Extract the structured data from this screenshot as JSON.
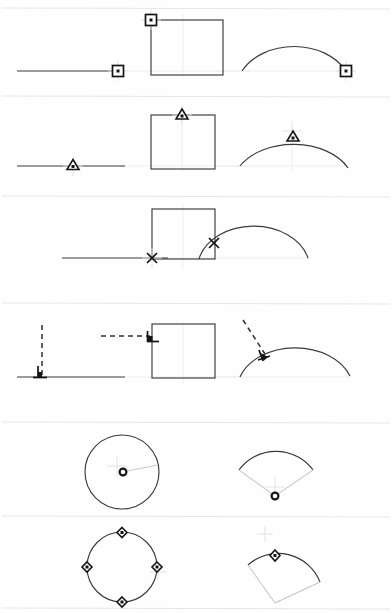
{
  "document": {
    "title": "Object Snap Reference Sheet",
    "background_color": "#fefefe",
    "width": 392,
    "height": 613,
    "geometry_stroke_color": "#3a3a3c",
    "marker_stroke_color": "#141418",
    "construction_line_color": "#2f2f33",
    "separator_color": "#e6e6ea",
    "ghost_guide_color": "#eeeef2"
  },
  "rows": [
    {
      "index": 1,
      "snap_name": "endpoint",
      "marker_glyph": "square",
      "marker_description": "hollow square with center dot",
      "separator_y": 8,
      "baseline_y": 71,
      "cells": [
        {
          "column": 1,
          "shape": "line",
          "shape_label": "horizontal line",
          "marker_x": 118,
          "marker_y": 71,
          "crosshair": true
        },
        {
          "column": 2,
          "shape": "square",
          "shape_label": "rectangle",
          "marker_x": 151,
          "marker_y": 20,
          "crosshair": true
        },
        {
          "column": 3,
          "shape": "arc",
          "shape_label": "arc",
          "marker_x": 346,
          "marker_y": 71,
          "crosshair": true
        }
      ]
    },
    {
      "index": 2,
      "snap_name": "midpoint",
      "marker_glyph": "triangle",
      "marker_description": "hollow triangle with center dot",
      "separator_y": 96,
      "baseline_y": 165,
      "cells": [
        {
          "column": 1,
          "shape": "line",
          "shape_label": "horizontal line",
          "marker_x": 73,
          "marker_y": 166,
          "crosshair": true
        },
        {
          "column": 2,
          "shape": "square",
          "shape_label": "rectangle",
          "marker_x": 182,
          "marker_y": 115,
          "crosshair": true
        },
        {
          "column": 3,
          "shape": "arc",
          "shape_label": "arc",
          "marker_x": 292,
          "marker_y": 137,
          "crosshair": true
        }
      ]
    },
    {
      "index": 3,
      "snap_name": "intersection",
      "marker_glyph": "cross-x",
      "marker_description": "X shaped cross",
      "separator_y": 196,
      "baseline_y": 258,
      "cells": [
        {
          "column": 2,
          "shape": "line-square-intersection",
          "shape_label": "line crossing rectangle edge",
          "marker_x": 152,
          "marker_y": 258,
          "crosshair": true
        },
        {
          "column": 3,
          "shape": "arc-square-intersection",
          "shape_label": "arc crossing rectangle edge",
          "marker_x": 214,
          "marker_y": 243,
          "crosshair": false
        }
      ]
    },
    {
      "index": 4,
      "snap_name": "perpendicular",
      "marker_glyph": "perpendicular",
      "marker_description": "perpendicular symbol with dashed construction line",
      "separator_y": 303,
      "baseline_y": 377,
      "cells": [
        {
          "column": 1,
          "shape": "line",
          "shape_label": "horizontal line with vertical dashed lead",
          "marker_x": 40,
          "marker_y": 377,
          "crosshair": true
        },
        {
          "column": 2,
          "shape": "square",
          "shape_label": "rectangle with horizontal dashed lead",
          "marker_x": 151,
          "marker_y": 336,
          "crosshair": true
        },
        {
          "column": 3,
          "shape": "arc",
          "shape_label": "arc with diagonal dashed lead",
          "marker_x": 263,
          "marker_y": 355,
          "crosshair": false
        }
      ]
    },
    {
      "index": 5,
      "snap_name": "center",
      "marker_glyph": "circle",
      "marker_description": "small hollow circle",
      "separator_y": 422,
      "baseline_y": 472,
      "cells": [
        {
          "column": 2,
          "shape": "circle",
          "shape_label": "full circle",
          "marker_x": 122,
          "marker_y": 472,
          "crosshair": true
        },
        {
          "column": 3,
          "shape": "sector",
          "shape_label": "arc sector",
          "marker_x": 275,
          "marker_y": 496,
          "crosshair": true
        }
      ]
    },
    {
      "index": 6,
      "snap_name": "quadrant",
      "marker_glyph": "diamond",
      "marker_description": "hollow diamond with center dot",
      "separator_y": 516,
      "baseline_y": 566,
      "cells": [
        {
          "column": 2,
          "shape": "circle",
          "shape_label": "full circle with four quadrant markers",
          "marker_points": [
            {
              "x": 122,
              "y": 532
            },
            {
              "x": 157,
              "y": 567
            },
            {
              "x": 122,
              "y": 602
            },
            {
              "x": 87,
              "y": 567
            }
          ],
          "crosshair": true
        },
        {
          "column": 3,
          "shape": "sector",
          "shape_label": "rotated arc sector",
          "marker_x": 275,
          "marker_y": 555,
          "crosshair": true
        }
      ]
    }
  ]
}
